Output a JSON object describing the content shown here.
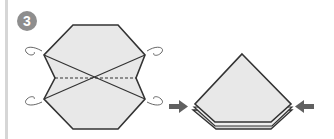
{
  "step": {
    "number": "3"
  },
  "colors": {
    "paper_fill": "#e8e8e8",
    "outline": "#333333",
    "badge": "#8e8e8e",
    "arrow": "#606060",
    "left_bar": "#d6d6d6"
  },
  "figures": [
    {
      "name": "hexagon-folded-paper",
      "description": "Elongated octagon with X crease lines and horizontal dashed valley fold; curved arrows at four corners indicate folding behind"
    },
    {
      "name": "pentagon-result",
      "description": "Resulting pointed shape (house shape) with layered bottom edges; arrows pushing inward from both sides"
    }
  ]
}
